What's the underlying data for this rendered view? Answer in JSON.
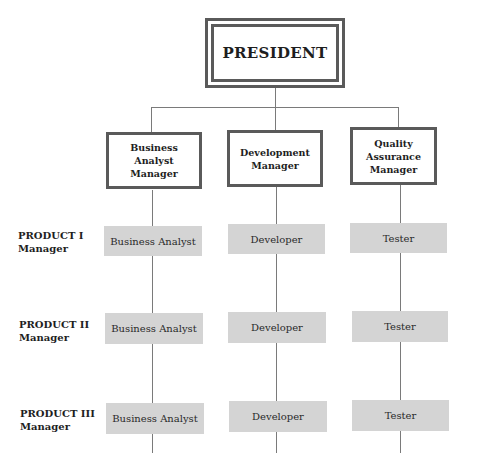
{
  "top": {
    "title": "PRESIDENT"
  },
  "managers": [
    {
      "label": "Business\nAnalyst\nManager",
      "lines": [
        "Business",
        "Analyst",
        "Manager"
      ]
    },
    {
      "label": "Development\nManager",
      "lines": [
        "Development",
        "Manager"
      ]
    },
    {
      "label": "Quality\nAssurance\nManager",
      "lines": [
        "Quality",
        "Assurance",
        "Manager"
      ]
    }
  ],
  "products": [
    {
      "lines": [
        "PRODUCT I",
        "Manager"
      ],
      "roles": [
        "Business Analyst",
        "Developer",
        "Tester"
      ]
    },
    {
      "lines": [
        "PRODUCT II",
        "Manager"
      ],
      "roles": [
        "Business Analyst",
        "Developer",
        "Tester"
      ]
    },
    {
      "lines": [
        "PRODUCT III",
        "Manager"
      ],
      "roles": [
        "Business Analyst",
        "Developer",
        "Tester"
      ]
    }
  ],
  "colors": {
    "border": "#5a5a5a",
    "connector": "#7a7a7a",
    "band": "#efefef",
    "role_box": "#d4d4d4"
  }
}
